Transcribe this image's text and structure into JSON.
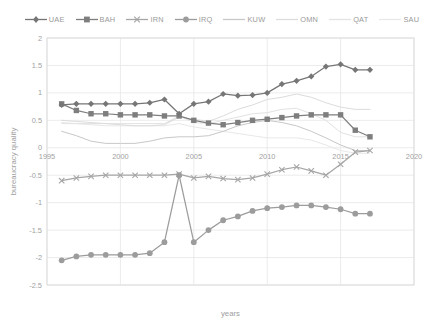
{
  "chart_data": {
    "type": "line",
    "title": "",
    "xlabel": "years",
    "ylabel": "bureaucracy quality",
    "xlim": [
      1995,
      2020
    ],
    "ylim": [
      -2.5,
      2
    ],
    "yticks": [
      "2",
      "1.5",
      "1",
      "0.5",
      "0",
      "-0.5",
      "-1",
      "-1.5",
      "-2",
      "-2.5"
    ],
    "ytick_values": [
      2,
      1.5,
      1,
      0.5,
      0,
      -0.5,
      -1,
      -1.5,
      -2,
      -2.5
    ],
    "xticks": [
      "1995",
      "2000",
      "2005",
      "2010",
      "2015",
      "2020"
    ],
    "xtick_values": [
      1995,
      2000,
      2005,
      2010,
      2015,
      2020
    ],
    "grid": true,
    "legend_position": "top",
    "x": [
      1996,
      1997,
      1998,
      1999,
      2000,
      2001,
      2002,
      2003,
      2004,
      2005,
      2006,
      2007,
      2008,
      2009,
      2010,
      2011,
      2012,
      2013,
      2014,
      2015,
      2016,
      2017
    ],
    "series": [
      {
        "name": "UAE",
        "color": "#767676",
        "marker": "diamond",
        "values": [
          0.78,
          0.8,
          0.8,
          0.8,
          0.8,
          0.8,
          0.82,
          0.88,
          0.62,
          0.8,
          0.84,
          0.98,
          0.95,
          0.96,
          1.0,
          1.16,
          1.22,
          1.3,
          1.48,
          1.52,
          1.42,
          1.42
        ]
      },
      {
        "name": "BAH",
        "color": "#7e7e7e",
        "marker": "square",
        "values": [
          0.8,
          0.68,
          0.62,
          0.62,
          0.6,
          0.6,
          0.6,
          0.58,
          0.58,
          0.5,
          0.45,
          0.42,
          0.46,
          0.5,
          0.52,
          0.55,
          0.58,
          0.6,
          0.6,
          0.6,
          0.32,
          0.2
        ]
      },
      {
        "name": "IRN",
        "color": "#a6a6a6",
        "marker": "cross",
        "values": [
          -0.6,
          -0.55,
          -0.52,
          -0.5,
          -0.5,
          -0.5,
          -0.5,
          -0.5,
          -0.48,
          -0.55,
          -0.52,
          -0.56,
          -0.58,
          -0.55,
          -0.48,
          -0.4,
          -0.35,
          -0.42,
          -0.5,
          -0.3,
          -0.08,
          -0.05
        ]
      },
      {
        "name": "IRQ",
        "color": "#9c9c9c",
        "marker": "circle",
        "values": [
          -2.05,
          -1.98,
          -1.95,
          -1.95,
          -1.95,
          -1.95,
          -1.92,
          -1.72,
          -0.5,
          -1.72,
          -1.5,
          -1.32,
          -1.25,
          -1.15,
          -1.1,
          -1.08,
          -1.05,
          -1.05,
          -1.08,
          -1.12,
          -1.2,
          -1.2
        ]
      },
      {
        "name": "KUW",
        "color": "#c8c8c8",
        "marker": "none",
        "values": [
          0.3,
          0.22,
          0.12,
          0.08,
          0.08,
          0.08,
          0.12,
          0.18,
          0.2,
          0.2,
          0.22,
          0.3,
          0.4,
          0.46,
          0.5,
          0.46,
          0.4,
          0.3,
          0.18,
          0.05,
          -0.05,
          -0.05
        ]
      },
      {
        "name": "OMN",
        "color": "#dcdcdc",
        "marker": "none",
        "values": [
          0.5,
          0.48,
          0.46,
          0.44,
          0.42,
          0.4,
          0.4,
          0.42,
          0.56,
          0.52,
          0.48,
          0.58,
          0.7,
          0.78,
          0.88,
          0.92,
          0.98,
          0.92,
          0.82,
          0.74,
          0.7,
          0.7
        ]
      },
      {
        "name": "QAT",
        "color": "#e2e2e2",
        "marker": "none",
        "values": [
          0.44,
          0.44,
          0.44,
          0.44,
          0.44,
          0.44,
          0.44,
          0.44,
          0.58,
          0.46,
          0.44,
          0.5,
          0.56,
          0.62,
          0.64,
          0.7,
          0.72,
          0.62,
          0.5,
          0.28,
          0.2,
          0.2
        ]
      },
      {
        "name": "SAU",
        "color": "#e8e8e8",
        "marker": "none",
        "values": [
          0.46,
          0.44,
          0.42,
          0.4,
          0.4,
          0.4,
          0.4,
          0.4,
          0.44,
          0.38,
          0.34,
          0.3,
          0.26,
          0.22,
          0.18,
          0.18,
          0.18,
          0.14,
          0.05,
          -0.05,
          -0.1,
          -0.1
        ]
      }
    ]
  },
  "legend": {
    "items": [
      {
        "label": "UAE"
      },
      {
        "label": "BAH"
      },
      {
        "label": "IRN"
      },
      {
        "label": "IRQ"
      },
      {
        "label": "KUW"
      },
      {
        "label": "OMN"
      },
      {
        "label": "QAT"
      },
      {
        "label": "SAU"
      }
    ]
  },
  "axes": {
    "y_title": "bureaucracy quality",
    "x_title": "years"
  }
}
